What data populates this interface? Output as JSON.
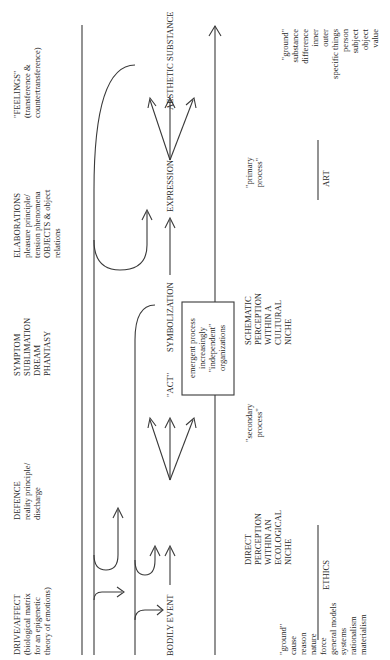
{
  "headings": {
    "feelings": [
      "\"FEELINGS\"",
      "(transference &",
      "countertransference)"
    ],
    "elaborations": [
      "ELABORATIONS",
      "pleasure principle/",
      "tension phenomena",
      "OBJECTS & object",
      "relations"
    ],
    "symptom": [
      "SYMPTOM",
      "SUBLIMATION",
      "DREAM",
      "PHANTASY"
    ],
    "defence": [
      "DEFENCE",
      "reality principle/",
      "discharge"
    ],
    "drive": [
      "DRIVE/AFFECT",
      "(biological matrix",
      "for an epigenetic",
      "theory of emotions)"
    ]
  },
  "axis_labels": {
    "bodily_event": "BODILY EVENT",
    "act": "\"ACT\"",
    "symbolization": "SYMBOLIZATION",
    "expression": "EXPRESSION",
    "aesthetic": "AESTHETIC SUBSTANCE"
  },
  "box": [
    "emergent process",
    "increasingly",
    "\"independent\"",
    "organizations"
  ],
  "processes": {
    "secondary": [
      "\"secondary",
      "process\""
    ],
    "primary": [
      "\"primary",
      "process\""
    ]
  },
  "perceptions": {
    "direct": [
      "DIRECT",
      "PERCEPTION",
      "WITHIN AN",
      "ECOLOGICAL",
      "NICHE"
    ],
    "schematic": [
      "SCHEMATIC",
      "PERCEPTION",
      "WITHIN A",
      "CULTURAL",
      "NICHE"
    ]
  },
  "domains": {
    "ethics": "ETHICS",
    "art": "ART"
  },
  "lists": {
    "left": [
      "\"ground\"",
      "cause",
      "reason",
      "nature",
      "force",
      "general models",
      "systems",
      "rationalism",
      "materialism"
    ],
    "right": [
      "\"ground\"",
      "substance",
      "difference",
      "inner",
      "outer",
      "specific things",
      "person",
      "subject",
      "object",
      "value"
    ]
  },
  "colors": {
    "line": "#3a3a3a",
    "text": "#2a2a2a",
    "background": "#ffffff"
  }
}
